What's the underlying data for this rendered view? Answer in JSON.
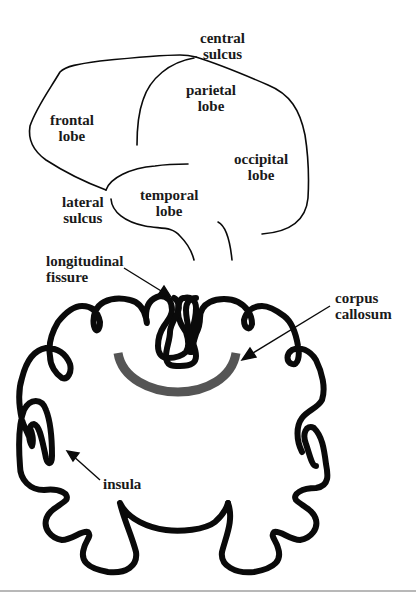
{
  "lateral_view": {
    "labels": {
      "central_sulcus": "central\nsulcus",
      "frontal_lobe": "frontal\nlobe",
      "parietal_lobe": "parietal\nlobe",
      "occipital_lobe": "occipital\nlobe",
      "temporal_lobe": "temporal\nlobe",
      "lateral_sulcus": "lateral\nsulcus"
    }
  },
  "coronal_view": {
    "labels": {
      "longitudinal_fissure": "longitudinal\nfissure",
      "corpus_callosum": "corpus\ncallosum",
      "insula": "insula"
    }
  },
  "colors": {
    "outline": "#0a0a0a",
    "corpus_callosum": "#555555",
    "text": "#1a1a1a",
    "background": "#ffffff"
  }
}
